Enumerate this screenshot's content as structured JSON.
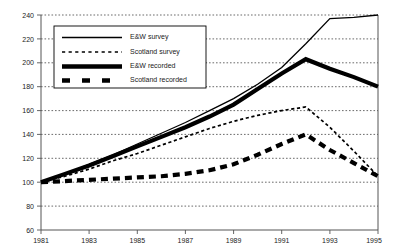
{
  "chart_data": {
    "type": "line",
    "title": "",
    "subtitle": "",
    "xlabel": "",
    "ylabel": "",
    "xlim": [
      1981,
      1995
    ],
    "ylim": [
      60,
      240
    ],
    "yticks": [
      60,
      80,
      100,
      120,
      140,
      160,
      180,
      200,
      220,
      240
    ],
    "xticks": [
      1981,
      1983,
      1985,
      1987,
      1989,
      1991,
      1993,
      1995
    ],
    "x": [
      1981,
      1982,
      1983,
      1984,
      1985,
      1986,
      1987,
      1988,
      1989,
      1990,
      1991,
      1992,
      1993,
      1994,
      1995
    ],
    "grid": true,
    "legend_position": "upper-left",
    "series": [
      {
        "name": "E&W survey",
        "style": "thin-solid",
        "color": "#000000",
        "values": [
          100,
          107,
          115,
          123,
          132,
          141,
          150,
          160,
          170,
          182,
          196,
          216,
          237,
          238,
          240
        ]
      },
      {
        "name": "Scotland survey",
        "style": "thin-dashed",
        "color": "#000000",
        "values": [
          100,
          105,
          111,
          118,
          124,
          131,
          138,
          145,
          151,
          156,
          160,
          163,
          146,
          126,
          105
        ]
      },
      {
        "name": "E&W recorded",
        "style": "thick-solid",
        "color": "#000000",
        "values": [
          100,
          107,
          114,
          122,
          130,
          138,
          146,
          155,
          165,
          178,
          191,
          203,
          195,
          188,
          180
        ]
      },
      {
        "name": "Scotland recorded",
        "style": "thick-dashed",
        "color": "#000000",
        "values": [
          100,
          101,
          102,
          103,
          104,
          105,
          107,
          110,
          115,
          123,
          132,
          140,
          127,
          116,
          105
        ]
      }
    ]
  },
  "axes": {
    "ylabels": [
      "240",
      "220",
      "200",
      "180",
      "160",
      "140",
      "120",
      "100",
      "80",
      "60"
    ],
    "xlabels": [
      "1981",
      "1983",
      "1985",
      "1987",
      "1989",
      "1991",
      "1993",
      "1995"
    ]
  },
  "legend": {
    "items": [
      {
        "label": "E&W survey",
        "swatch": "thin-solid-swatch"
      },
      {
        "label": "Scotland survey",
        "swatch": "thin-dashed-swatch"
      },
      {
        "label": "E&W recorded",
        "swatch": "thick-solid-swatch"
      },
      {
        "label": "Scotland recorded",
        "swatch": "thick-dashed-swatch"
      }
    ]
  }
}
